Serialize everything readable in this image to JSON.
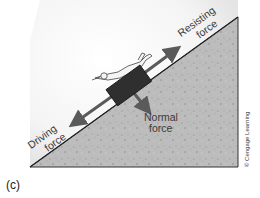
{
  "figure": {
    "panel_label": "(c)",
    "labels": {
      "resisting_line1": "Resisting",
      "resisting_line2": "force",
      "driving_line1": "Driving",
      "driving_line2": "force",
      "normal_line1": "Normal",
      "normal_line2": "force",
      "credit": "© Cengage Learning"
    },
    "colors": {
      "slope_fill": "#b9b9b9",
      "block": "#2f2f2f",
      "arrow": "#5a5a5a",
      "text": "#3a3a3a"
    }
  }
}
